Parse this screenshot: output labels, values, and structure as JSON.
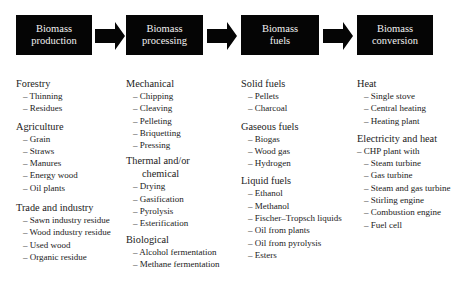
{
  "stages": [
    {
      "line1": "Biomass",
      "line2": "production"
    },
    {
      "line1": "Biomass",
      "line2": "processing"
    },
    {
      "line1": "Biomass",
      "line2": "fuels"
    },
    {
      "line1": "Biomass",
      "line2": "conversion"
    }
  ],
  "columns": {
    "production": {
      "sections": [
        {
          "title": "Forestry",
          "items": [
            "– Thinning",
            "– Residues"
          ]
        },
        {
          "title": "Agriculture",
          "items": [
            "– Grain",
            "– Straws",
            "– Manures",
            "– Energy wood",
            "– Oil plants"
          ]
        },
        {
          "title": "Trade and industry",
          "items": [
            "– Sawn industry residue",
            "– Wood industry residue",
            "– Used wood",
            "– Organic residue"
          ]
        }
      ]
    },
    "processing": {
      "sections": [
        {
          "title": "Mechanical",
          "items": [
            "– Chipping",
            "– Cleaving",
            "– Pelleting",
            "– Briquetting",
            "– Pressing"
          ]
        },
        {
          "title": "Thermal and/or",
          "title2": "chemical",
          "items": [
            "– Drying",
            "– Gasification",
            "– Pyrolysis",
            "– Esterification"
          ]
        },
        {
          "title": "Biological",
          "items": [
            "– Alcohol fermentation",
            "– Methane fermentation"
          ]
        }
      ]
    },
    "fuels": {
      "sections": [
        {
          "title": "Solid fuels",
          "items": [
            "– Pellets",
            "– Charcoal"
          ]
        },
        {
          "title": "Gaseous fuels",
          "items": [
            "– Biogas",
            "– Wood gas",
            "– Hydrogen"
          ]
        },
        {
          "title": "Liquid fuels",
          "items": [
            "– Ethanol",
            "– Methanol",
            "– Fischer–Tropsch liquids",
            "– Oil from plants",
            "– Oil from pyrolysis",
            "– Esters"
          ]
        }
      ]
    },
    "conversion": {
      "sections": [
        {
          "title": "Heat",
          "items": [
            "– Single stove",
            "– Central heating",
            "– Heating plant"
          ]
        },
        {
          "title": "Electricity and heat",
          "lead": "– CHP plant with",
          "items": [
            "– Steam turbine",
            "– Gas turbine",
            "– Steam and gas turbine",
            "– Stirling engine",
            "– Combustion engine",
            "– Fuel cell"
          ]
        }
      ]
    }
  },
  "colors": {
    "box": "#050505",
    "box_text": "#f2f2f2",
    "text": "#222222"
  }
}
